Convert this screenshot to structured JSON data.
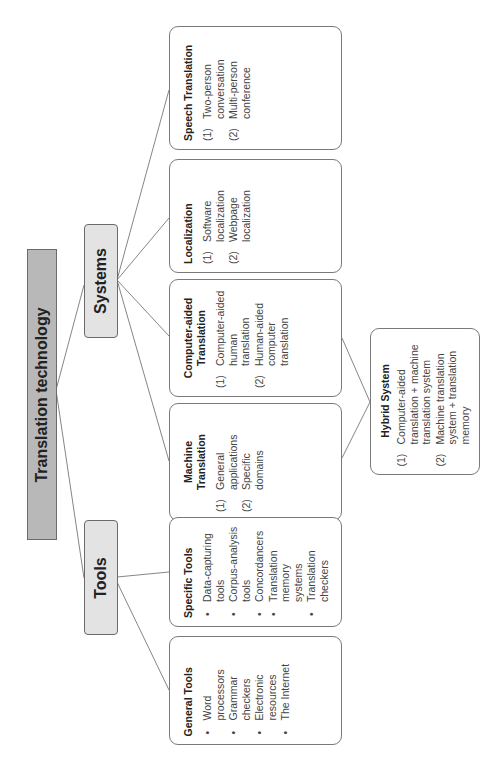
{
  "root": {
    "label": "Translation technology"
  },
  "branches": {
    "systems": {
      "label": "Systems"
    },
    "tools": {
      "label": "Tools"
    }
  },
  "systems": [
    {
      "title": "Speech Translation",
      "style": "numbered",
      "items": [
        {
          "n": "(1)",
          "text": "Two-person conversation"
        },
        {
          "n": "(2)",
          "text": "Multi-person conference"
        }
      ]
    },
    {
      "title": "Localization",
      "style": "numbered",
      "items": [
        {
          "n": "(1)",
          "text": "Software localization"
        },
        {
          "n": "(2)",
          "text": "Webpage localization"
        }
      ]
    },
    {
      "title": "Computer-aided Translation",
      "style": "numbered",
      "items": [
        {
          "n": "(1)",
          "text": "Computer-aided human translation"
        },
        {
          "n": "(2)",
          "text": "Human-aided computer translation"
        }
      ]
    },
    {
      "title": "Machine Translation",
      "style": "numbered",
      "items": [
        {
          "n": "(1)",
          "text": "General applications"
        },
        {
          "n": "(2)",
          "text": "Specific domains"
        }
      ]
    }
  ],
  "tools": [
    {
      "title": "Specific Tools",
      "style": "bulleted",
      "items": [
        {
          "n": "•",
          "text": "Data-capturing tools"
        },
        {
          "n": "•",
          "text": "Corpus-analysis tools"
        },
        {
          "n": "•",
          "text": "Concordancers"
        },
        {
          "n": "•",
          "text": "Translation memory systems"
        },
        {
          "n": "•",
          "text": "Translation checkers"
        }
      ]
    },
    {
      "title": "General Tools",
      "style": "bulleted",
      "items": [
        {
          "n": "•",
          "text": "Word processors"
        },
        {
          "n": "•",
          "text": "Grammar checkers"
        },
        {
          "n": "•",
          "text": "Electronic resources"
        },
        {
          "n": "•",
          "text": "The Internet"
        }
      ]
    }
  ],
  "hybrid": {
    "title": "Hybrid System",
    "items": [
      {
        "n": "(1)",
        "text": "Computer-aided translation + machine translation system"
      },
      {
        "n": "(2)",
        "text": "Machine translation system + translation memory"
      }
    ]
  },
  "colors": {
    "root_fill": "#b8b8b8",
    "branch_fill": "#e3e3e3",
    "card_border": "#7a7a7a",
    "line": "#555555"
  }
}
